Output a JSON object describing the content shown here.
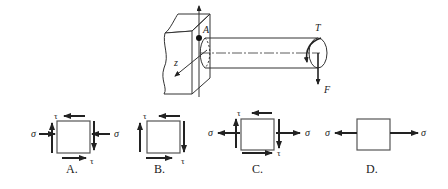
{
  "figure": {
    "point_label": "A",
    "axis_label": "z",
    "torque_label": "T",
    "force_label": "F"
  },
  "options": [
    {
      "letter": "A.",
      "sigma_left": "σ",
      "sigma_right": "σ",
      "tau_top": "τ",
      "tau_bottom": "τ",
      "normal_stress": "compression",
      "shear": true
    },
    {
      "letter": "B.",
      "tau_top": "τ",
      "tau_bottom": "τ",
      "normal_stress": "none",
      "shear": true
    },
    {
      "letter": "C.",
      "sigma_left": "σ",
      "sigma_right": "σ",
      "tau_top": "τ",
      "tau_bottom": "τ",
      "normal_stress": "tension",
      "shear": true
    },
    {
      "letter": "D.",
      "sigma_left": "σ",
      "sigma_right": "σ",
      "normal_stress": "tension",
      "shear": false
    }
  ],
  "colors": {
    "line": "#333333",
    "arrow": "#222222"
  }
}
